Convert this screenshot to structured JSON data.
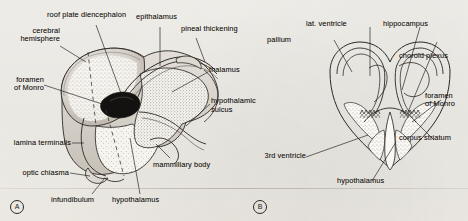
{
  "figure": {
    "panels": [
      {
        "id": "A",
        "letter": "A",
        "view": "sagittal-section"
      },
      {
        "id": "B",
        "letter": "B",
        "view": "coronal-section"
      }
    ]
  },
  "panel_a": {
    "letter": "A",
    "labels": {
      "roof_plate_diencephalon": "roof plate diencephalon",
      "epithalamus": "epithalamus",
      "pineal_thickening": "pineal thickening",
      "cerebral_hemisphere_l1": "cerebral",
      "cerebral_hemisphere_l2": "hemisphere",
      "thalamus": "thalamus",
      "foramen_of_monro_l1": "foramen",
      "foramen_of_monro_l2": "of Monro",
      "hypothalamic_sulcus_l1": "hypothalamic",
      "hypothalamic_sulcus_l2": "sulcus",
      "lamina_terminalis": "lamina terminalis",
      "optic_chiasma": "optic chiasma",
      "mammillary_body": "mammillary body",
      "infundibulum": "infundibulum",
      "hypothalamus": "hypothalamus"
    }
  },
  "panel_b": {
    "letter": "B",
    "labels": {
      "lateral_ventricle": "lat. ventricle",
      "hippocampus": "hippocampus",
      "pallium": "pallium",
      "choroid_plexus": "choroid plexus",
      "foramen_of_monro_l1": "foramen",
      "foramen_of_monro_l2": "of Monro",
      "corpus_striatum": "corpus striatum",
      "third_ventricle": "3rd ventricle",
      "hypothalamus": "hypothalamus"
    }
  },
  "colors": {
    "ink": "#1d1b18",
    "line": "#2b2825",
    "paper": "#f3f1ec",
    "stipple": "#6b6560",
    "shade": "#cfcac2"
  }
}
